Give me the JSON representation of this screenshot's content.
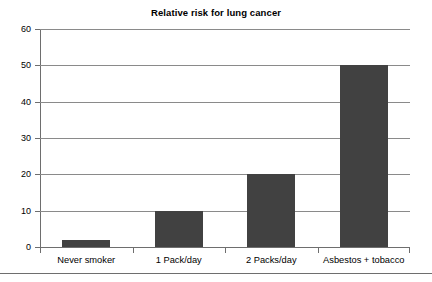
{
  "chart_data": {
    "type": "bar",
    "title": "Relative risk for lung cancer",
    "xlabel": "",
    "ylabel": "",
    "categories": [
      "Never smoker",
      "1 Pack/day",
      "2 Packs/day",
      "Asbestos + tobacco"
    ],
    "values": [
      2,
      10,
      20,
      50
    ],
    "ylim": [
      0,
      60
    ],
    "ytick_labels": [
      "0",
      "10",
      "20",
      "30",
      "40",
      "50",
      "60"
    ],
    "ytick_values": [
      0,
      10,
      20,
      30,
      40,
      50,
      60
    ],
    "grid": "horizontal",
    "legend": "none",
    "bar_color": "#414141",
    "axis_color": "#6e6e6e",
    "gridline_color": "#8a8a8a",
    "background_color": "#ffffff",
    "text_color": "#000000"
  },
  "figure": {
    "bottom_rule": ""
  }
}
